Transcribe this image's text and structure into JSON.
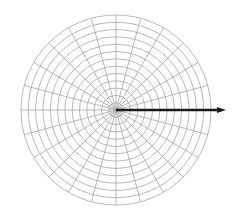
{
  "figure": {
    "title": "",
    "background_color": "#ffffff",
    "width": 237,
    "height": 223
  },
  "chart_data": {
    "type": "line",
    "subtype": "polar-vector-plot",
    "title": "",
    "subtitle": "",
    "xlabel": "",
    "ylabel": "",
    "projection": "polar",
    "grid": true,
    "grid_color": "#a6a6a6",
    "legend": false,
    "legend_position": "none",
    "axis_tick_labels_visible": false,
    "center": {
      "x": 116,
      "y": 110
    },
    "radial_axis": {
      "label": "",
      "rlim": [
        0,
        13
      ],
      "ring_count": 13,
      "ring_step": 1,
      "ring_radii_px": [
        7.3,
        14.6,
        21.9,
        29.2,
        36.5,
        43.8,
        51.2,
        58.5,
        65.8,
        73.1,
        80.4,
        87.7,
        95.0
      ],
      "tick_labels": []
    },
    "angular_axis": {
      "label": "",
      "spoke_count": 24,
      "spoke_step_degrees": 15,
      "theta_zero_location": "E",
      "theta_direction": "counterclockwise",
      "tick_labels": []
    },
    "series": [
      {
        "name": "vector",
        "type": "arrow",
        "color": "#1a1a1a",
        "linewidth": 2.6,
        "theta_degrees": 0,
        "r": 15.1,
        "r_px": 110,
        "start": {
          "theta_degrees": 0,
          "r": 0
        },
        "end": {
          "theta_degrees": 0,
          "r": 15.1
        },
        "arrowhead": true
      }
    ]
  }
}
